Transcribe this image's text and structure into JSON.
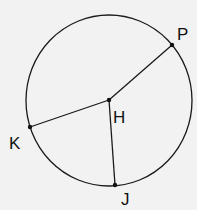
{
  "diagram": {
    "type": "circle-with-radii",
    "background": "#f2f2f2",
    "stroke": "#1a1a1a",
    "circle": {
      "cx": 109,
      "cy": 100.5,
      "rx": 83,
      "ry": 85.5
    },
    "center": {
      "name": "H",
      "x": 109,
      "y": 100,
      "label": "H",
      "label_x": 113,
      "label_y": 123
    },
    "points": [
      {
        "name": "P",
        "x": 172,
        "y": 45,
        "label": "P",
        "label_x": 177,
        "label_y": 40
      },
      {
        "name": "K",
        "x": 30,
        "y": 127,
        "label": "K",
        "label_x": 9,
        "label_y": 149
      },
      {
        "name": "J",
        "x": 115,
        "y": 185,
        "label": "J",
        "label_x": 121,
        "label_y": 205
      }
    ],
    "segments": [
      {
        "from": "H",
        "to": "P"
      },
      {
        "from": "H",
        "to": "K"
      },
      {
        "from": "H",
        "to": "J"
      }
    ]
  }
}
